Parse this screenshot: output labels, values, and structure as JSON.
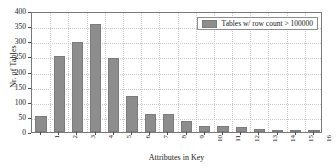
{
  "chart_data": {
    "type": "bar",
    "title": "",
    "xlabel": "Attributes in Key",
    "ylabel": "Nr. of Tables",
    "categories": [
      "1",
      "2",
      "3",
      "4",
      "5",
      "6",
      "7",
      "8",
      "9",
      "10",
      "11",
      "12",
      "13",
      "14",
      "15",
      "16"
    ],
    "values": [
      53,
      252,
      297,
      358,
      246,
      119,
      59,
      58,
      38,
      21,
      21,
      18,
      11,
      8,
      7,
      5
    ],
    "series": [
      {
        "name": "Tables w/ row count > 100000",
        "values": [
          53,
          252,
          297,
          358,
          246,
          119,
          59,
          58,
          38,
          21,
          21,
          18,
          11,
          8,
          7,
          5
        ],
        "color": "#8d8d8d"
      }
    ],
    "ylim": [
      0,
      400
    ],
    "yticks": [
      0,
      50,
      100,
      150,
      200,
      250,
      300,
      350,
      400
    ],
    "ytick_labels": [
      "0",
      "50",
      "100",
      "150",
      "200",
      "250",
      "300",
      "350",
      "400"
    ],
    "grid": true,
    "grid_style": "dotted",
    "legend_position": "top-right",
    "legend_entries": [
      "Tables w/ row count > 100000"
    ]
  },
  "legend": {
    "label": "Tables w/ row count > 100000",
    "swatch_color": "#8d8d8d"
  },
  "axes": {
    "x_title": "Attributes in Key",
    "y_title": "Nr. of Tables"
  },
  "colors": {
    "bar": "#8d8d8d",
    "bar_edge": "#7c7c7c",
    "grid": "#c9c9c9",
    "frame": "#7a7a7a",
    "text": "#1a1a1a",
    "background": "#ffffff"
  }
}
